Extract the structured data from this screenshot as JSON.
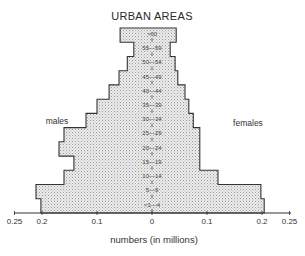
{
  "chart_data": {
    "type": "bar",
    "subtype": "population-pyramid",
    "title": "URBAN AREAS",
    "xlabel": "numbers (in millions)",
    "ylabel": "",
    "categories": [
      ">60",
      "55—59",
      "50—54",
      "45—49",
      "40—44",
      "35—39",
      "30—34",
      "25—29",
      "20—24",
      "15—19",
      "10—14",
      "5—9",
      "<1—4"
    ],
    "series": [
      {
        "name": "males",
        "side": "left",
        "values": [
          0.058,
          0.033,
          0.045,
          0.06,
          0.078,
          0.1,
          0.12,
          0.16,
          0.169,
          0.142,
          0.16,
          0.211,
          0.202
        ]
      },
      {
        "name": "females",
        "side": "right",
        "values": [
          0.044,
          0.033,
          0.042,
          0.047,
          0.06,
          0.067,
          0.075,
          0.087,
          0.087,
          0.087,
          0.12,
          0.198,
          0.204
        ]
      }
    ],
    "xlim": [
      -0.25,
      0.25
    ],
    "x_ticks": [
      {
        "value": -0.25,
        "label": "0.25"
      },
      {
        "value": -0.2,
        "label": "0.2"
      },
      {
        "value": -0.1,
        "label": "0.1"
      },
      {
        "value": 0,
        "label": "0"
      },
      {
        "value": 0.1,
        "label": "0.1"
      },
      {
        "value": 0.2,
        "label": "0.2"
      },
      {
        "value": 0.25,
        "label": "0.25"
      }
    ],
    "annotations": [
      {
        "text": "males",
        "position": "left"
      },
      {
        "text": "females",
        "position": "right"
      }
    ],
    "grid": false,
    "legend": "none",
    "fill": "stippled light grey",
    "colors": {
      "fill": "#d9d9d9",
      "outline": "#333333"
    }
  }
}
